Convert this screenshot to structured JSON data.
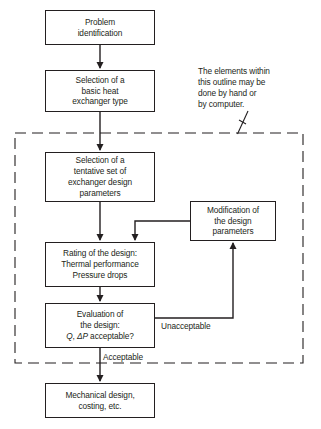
{
  "diagram": {
    "line_color": "#231f20",
    "background": "#ffffff",
    "boxes": [
      {
        "id": "problem",
        "lines": [
          "Problem",
          "identification"
        ],
        "x": 45,
        "y": 10,
        "w": 110,
        "h": 35
      },
      {
        "id": "basic_type",
        "lines": [
          "Selection of a",
          "basic heat",
          "exchanger type"
        ],
        "x": 45,
        "y": 70,
        "w": 110,
        "h": 42
      },
      {
        "id": "tentative",
        "lines": [
          "Selection of a",
          "tentative set of",
          "exchanger design",
          "parameters"
        ],
        "x": 45,
        "y": 152,
        "w": 110,
        "h": 50
      },
      {
        "id": "modification",
        "lines": [
          "Modification of",
          "the design",
          "parameters"
        ],
        "x": 190,
        "y": 201,
        "w": 86,
        "h": 40
      },
      {
        "id": "rating",
        "lines": [
          "Rating of the design:",
          "Thermal performance",
          "Pressure drops"
        ],
        "x": 45,
        "y": 242,
        "w": 110,
        "h": 45
      },
      {
        "id": "evaluation",
        "lines": [
          "Evaluation of",
          "the design:"
        ],
        "math_line": {
          "prefix": "Q",
          "sep": ", ",
          "delta": "ΔP",
          "suffix": " acceptable?"
        },
        "x": 45,
        "y": 303,
        "w": 110,
        "h": 45
      },
      {
        "id": "mechanical",
        "lines": [
          "Mechanical design,",
          "costing, etc."
        ],
        "x": 45,
        "y": 383,
        "w": 110,
        "h": 35
      }
    ],
    "annotation": {
      "id": "outline-note",
      "text": "The elements within\nthis outline may be\ndone by hand or\nby computer.",
      "x": 198,
      "y": 66
    },
    "edge_labels": [
      {
        "id": "unacceptable",
        "text": "Unacceptable",
        "x": 160,
        "y": 325
      },
      {
        "id": "acceptable",
        "text": "Acceptable",
        "x": 102,
        "y": 356
      }
    ],
    "dashed_region": {
      "x": 15,
      "y": 133,
      "w": 288,
      "h": 230,
      "style": "dashed"
    },
    "caption": ""
  }
}
